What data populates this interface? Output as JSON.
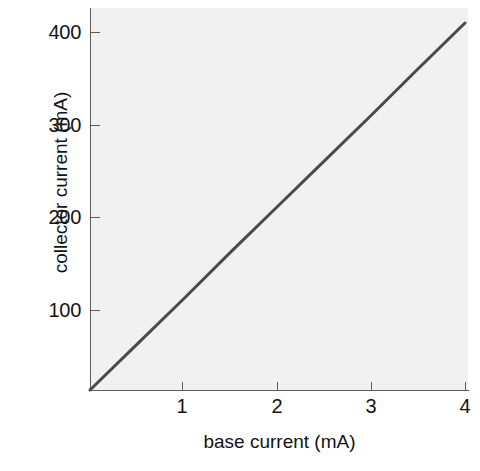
{
  "figure": {
    "background_color": "#ffffff",
    "plot_background_color": "#f1f1f1",
    "axis_color": "#5d5d5d",
    "line_color": "#4a4a4a"
  },
  "chart_data": {
    "type": "line",
    "title": "",
    "subtitle": "",
    "xlabel": "base current (mA)",
    "ylabel": "collector current (mA)",
    "xlim": [
      0,
      4.04
    ],
    "ylim": [
      0,
      414
    ],
    "xticks": [
      1,
      2,
      3,
      4
    ],
    "xtick_labels": [
      "1",
      "2",
      "3",
      "4"
    ],
    "yticks": [
      100,
      200,
      300,
      400
    ],
    "ytick_labels": [
      "100",
      "200",
      "300",
      "400"
    ],
    "grid": false,
    "legend": null,
    "legend_position": "none",
    "annotations": [],
    "series": [
      {
        "name": "collector current vs base current",
        "x": [
          0,
          0.5,
          1,
          1.5,
          2,
          2.5,
          3,
          3.5,
          4
        ],
        "values": [
          0,
          51,
          102,
          154,
          205,
          256,
          307,
          359,
          410
        ],
        "slope": 102.5,
        "intercept": 0,
        "color": "#4a4a4a",
        "style": "solid",
        "width": 3
      }
    ]
  }
}
